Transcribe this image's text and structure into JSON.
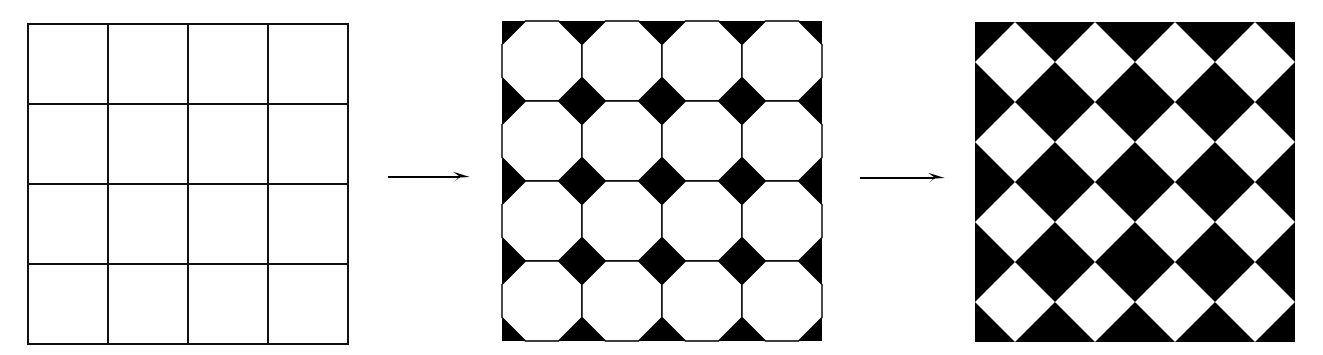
{
  "figure": {
    "background_color": "#ffffff",
    "ink_color": "#000000",
    "width": 1323,
    "height": 355,
    "stage_count": 3,
    "arrow_count": 2
  },
  "panels": [
    {
      "id": "panel-1",
      "name": "square-grid",
      "label": "Square grid (untruncated)",
      "x": 28,
      "y": 24,
      "size": 320,
      "rows": 4,
      "cols": 4,
      "cell": 80,
      "truncation": 0.0,
      "stroke_color": "#111111",
      "stroke_width": 2,
      "fill_color": "#ffffff",
      "background_color": "#ffffff",
      "tile_shape": "square",
      "tile_count": 16,
      "vertex_shape": "none"
    },
    {
      "id": "panel-2",
      "name": "octagon-tiling",
      "label": "Octagon tiling (partial truncation)",
      "x": 502,
      "y": 21,
      "size": 320,
      "rows": 4,
      "cols": 4,
      "cell": 80,
      "truncation": 0.293,
      "stroke_color": "#000000",
      "stroke_width": 1.4,
      "fill_color": "#ffffff",
      "background_color": "#000000",
      "tile_shape": "octagon",
      "tile_count": 16,
      "vertex_shape": "diamond"
    },
    {
      "id": "panel-3",
      "name": "diamond-tiling",
      "label": "Diamond tiling (full truncation)",
      "x": 975,
      "y": 22,
      "size": 320,
      "rows": 4,
      "cols": 4,
      "cell": 80,
      "truncation": 0.5,
      "stroke_color": "#000000",
      "stroke_width": 0,
      "fill_color": "#ffffff",
      "background_color": "#000000",
      "tile_shape": "diamond",
      "tile_count": 16,
      "vertex_shape": "none"
    }
  ],
  "arrows": [
    {
      "id": "arrow-1",
      "name": "transform-arrow-1",
      "from": "panel-1",
      "to": "panel-2",
      "x": 388,
      "y": 177,
      "length": 82,
      "direction": "right",
      "color": "#000000",
      "label": ""
    },
    {
      "id": "arrow-2",
      "name": "transform-arrow-2",
      "from": "panel-2",
      "to": "panel-3",
      "x": 860,
      "y": 178,
      "length": 85,
      "direction": "right",
      "color": "#000000",
      "label": ""
    }
  ]
}
